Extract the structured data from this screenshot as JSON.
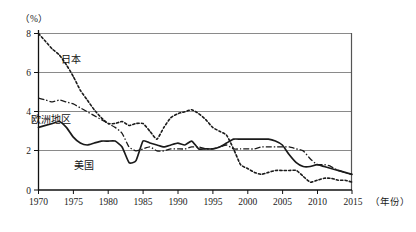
{
  "chart_data": {
    "type": "line",
    "title": "",
    "subtitle": "",
    "xlabel": "年份",
    "ylabel": "",
    "y_unit": "（%）",
    "xlim": [
      1970,
      2015
    ],
    "ylim": [
      0,
      8
    ],
    "y_ticks": [
      "0",
      "2",
      "4",
      "6",
      "8"
    ],
    "y_tick_values": [
      0,
      2,
      4,
      6,
      8
    ],
    "x_ticks": [
      "1970",
      "1975",
      "1980",
      "1985",
      "1990",
      "1995",
      "2000",
      "2005",
      "2010",
      "2015"
    ],
    "x_tick_values": [
      1970,
      1975,
      1980,
      1985,
      1990,
      1995,
      2000,
      2005,
      2010,
      2015
    ],
    "grid": "horizontal",
    "legend_position": "inline-annotations",
    "x": [
      1970,
      1971,
      1972,
      1973,
      1974,
      1975,
      1976,
      1977,
      1978,
      1979,
      1980,
      1981,
      1982,
      1983,
      1984,
      1985,
      1986,
      1987,
      1988,
      1989,
      1990,
      1991,
      1992,
      1993,
      1994,
      1995,
      1996,
      1997,
      1998,
      1999,
      2000,
      2001,
      2002,
      2003,
      2004,
      2005,
      2006,
      2007,
      2008,
      2009,
      2010,
      2011,
      2012,
      2013,
      2014,
      2015
    ],
    "series": [
      {
        "name": "日本",
        "label": "日本",
        "style": "dotted",
        "color": "#1a1a1a",
        "values": [
          8.0,
          7.6,
          7.2,
          6.9,
          6.4,
          5.8,
          5.1,
          4.6,
          4.1,
          3.7,
          3.4,
          3.4,
          3.5,
          3.3,
          3.4,
          3.4,
          3.0,
          2.6,
          3.2,
          3.7,
          3.9,
          4.0,
          4.1,
          3.9,
          3.6,
          3.2,
          3.0,
          2.8,
          2.1,
          1.3,
          1.1,
          0.9,
          0.8,
          0.9,
          1.0,
          1.0,
          1.0,
          1.0,
          0.7,
          0.4,
          0.5,
          0.6,
          0.6,
          0.5,
          0.5,
          0.4
        ]
      },
      {
        "name": "欧洲地区",
        "label": "欧洲地区",
        "style": "dash-dot",
        "color": "#1a1a1a",
        "values": [
          4.7,
          4.6,
          4.5,
          4.6,
          4.5,
          4.4,
          4.2,
          4.0,
          3.8,
          3.6,
          3.4,
          3.2,
          2.9,
          2.2,
          2.0,
          2.1,
          2.2,
          2.0,
          2.0,
          2.1,
          2.1,
          2.1,
          2.2,
          2.2,
          2.1,
          2.1,
          2.2,
          2.3,
          2.1,
          2.1,
          2.1,
          2.1,
          2.2,
          2.2,
          2.2,
          2.2,
          2.2,
          2.1,
          2.0,
          1.6,
          1.3,
          1.3,
          1.2,
          1.0,
          0.9,
          0.8
        ]
      },
      {
        "name": "美国",
        "label": "美国",
        "style": "solid",
        "color": "#1a1a1a",
        "values": [
          3.2,
          3.3,
          3.4,
          3.5,
          3.2,
          2.7,
          2.4,
          2.3,
          2.4,
          2.5,
          2.5,
          2.5,
          2.2,
          1.4,
          1.5,
          2.5,
          2.4,
          2.3,
          2.2,
          2.3,
          2.4,
          2.3,
          2.5,
          2.1,
          2.1,
          2.1,
          2.2,
          2.4,
          2.6,
          2.6,
          2.6,
          2.6,
          2.6,
          2.6,
          2.5,
          2.3,
          1.8,
          1.4,
          1.2,
          1.2,
          1.3,
          1.2,
          1.1,
          1.0,
          0.9,
          0.8
        ]
      }
    ],
    "annotations": [
      {
        "text": "日本",
        "x": 1972.8,
        "y": 6.8
      },
      {
        "text": "欧洲地区",
        "x": 1970.2,
        "y": 3.75
      },
      {
        "text": "美国",
        "x": 1974.3,
        "y": 1.6
      }
    ]
  }
}
